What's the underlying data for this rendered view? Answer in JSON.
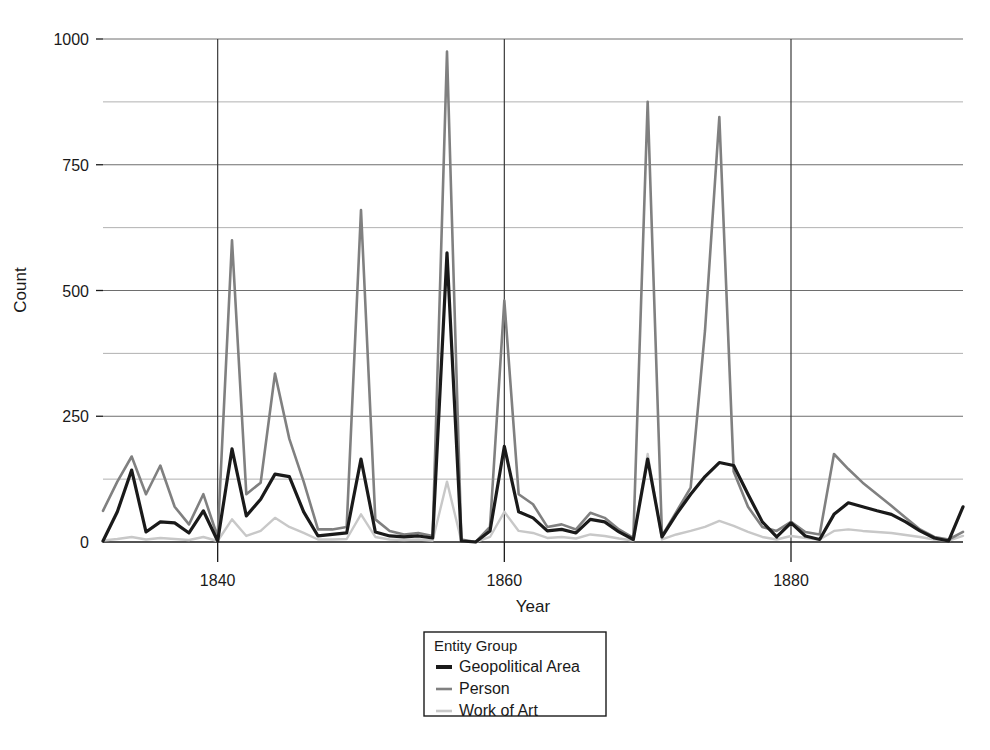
{
  "chart_data": {
    "type": "line",
    "title": "",
    "xlabel": "Year",
    "ylabel": "Count",
    "xlim": [
      1832,
      1892
    ],
    "ylim": [
      0,
      1000
    ],
    "grid": true,
    "legend_position": "bottom-center",
    "legend_title": "Entity Group",
    "x_ticks": [
      1840,
      1860,
      1880
    ],
    "x_tick_labels": [
      "1840",
      "1860",
      "1880"
    ],
    "y_ticks": [
      0,
      250,
      500,
      750,
      1000
    ],
    "y_tick_labels": [
      "0",
      "250",
      "500",
      "750",
      "1000"
    ],
    "y_minor_gridlines": [
      125,
      375,
      625,
      875
    ],
    "x": [
      1832,
      1833,
      1834,
      1835,
      1836,
      1837,
      1838,
      1839,
      1840,
      1841,
      1842,
      1843,
      1844,
      1845,
      1846,
      1847,
      1848,
      1849,
      1850,
      1851,
      1852,
      1853,
      1854,
      1855,
      1856,
      1857,
      1858,
      1859,
      1860,
      1861,
      1862,
      1863,
      1864,
      1865,
      1866,
      1867,
      1868,
      1869,
      1870,
      1871,
      1872,
      1873,
      1874,
      1875,
      1876,
      1877,
      1878,
      1879,
      1880,
      1881,
      1882,
      1883,
      1884,
      1885,
      1886,
      1887,
      1888,
      1889,
      1890,
      1891,
      1892
    ],
    "series": [
      {
        "name": "Geopolitical Area",
        "color": "#1a1a1a",
        "width": 3.2,
        "values": [
          2,
          60,
          143,
          20,
          40,
          38,
          18,
          62,
          2,
          185,
          52,
          85,
          135,
          130,
          60,
          12,
          15,
          18,
          165,
          20,
          12,
          10,
          12,
          8,
          575,
          2,
          0,
          22,
          190,
          60,
          48,
          22,
          25,
          18,
          45,
          40,
          20,
          5,
          165,
          10,
          55,
          95,
          130,
          158,
          152,
          95,
          40,
          10,
          38,
          12,
          5,
          55,
          78,
          70,
          62,
          55,
          40,
          22,
          8,
          2,
          70
        ]
      },
      {
        "name": "Person",
        "color": "#808080",
        "width": 2.6,
        "values": [
          62,
          120,
          170,
          95,
          152,
          70,
          35,
          95,
          10,
          600,
          95,
          118,
          335,
          205,
          120,
          25,
          25,
          30,
          660,
          45,
          22,
          15,
          18,
          12,
          975,
          5,
          0,
          30,
          480,
          95,
          75,
          30,
          35,
          25,
          58,
          48,
          25,
          8,
          875,
          12,
          60,
          108,
          420,
          845,
          140,
          70,
          30,
          22,
          40,
          20,
          15,
          175,
          145,
          118,
          95,
          72,
          48,
          25,
          10,
          5,
          20
        ]
      },
      {
        "name": "Work of Art",
        "color": "#c8c8c8",
        "width": 2.4,
        "values": [
          3,
          6,
          10,
          5,
          8,
          6,
          4,
          10,
          2,
          45,
          12,
          22,
          48,
          30,
          18,
          5,
          5,
          6,
          55,
          10,
          5,
          4,
          5,
          3,
          120,
          2,
          0,
          10,
          60,
          22,
          18,
          8,
          10,
          7,
          15,
          12,
          7,
          3,
          175,
          5,
          15,
          22,
          30,
          42,
          32,
          20,
          10,
          5,
          12,
          8,
          5,
          22,
          25,
          22,
          20,
          18,
          14,
          10,
          5,
          3,
          12
        ]
      }
    ]
  },
  "legend": {
    "title": "Entity Group",
    "entries": [
      {
        "label": "Geopolitical Area",
        "color": "#1a1a1a",
        "swatch": "line-swatch"
      },
      {
        "label": "Person",
        "color": "#808080",
        "swatch": "line-swatch"
      },
      {
        "label": "Work of Art",
        "color": "#c8c8c8",
        "swatch": "line-swatch"
      }
    ]
  }
}
